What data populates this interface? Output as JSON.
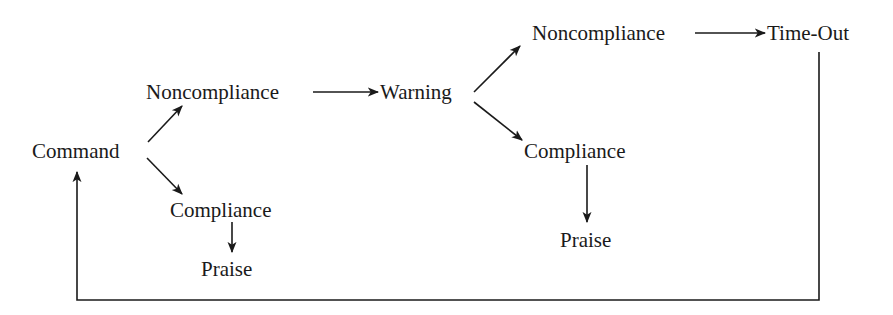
{
  "diagram": {
    "type": "flowchart",
    "nodes": {
      "command": "Command",
      "noncompliance1": "Noncompliance",
      "compliance1": "Compliance",
      "praise1": "Praise",
      "warning": "Warning",
      "noncompliance2": "Noncompliance",
      "timeout": "Time-Out",
      "compliance2": "Compliance",
      "praise2": "Praise"
    },
    "edges": [
      {
        "from": "Command",
        "to": "Noncompliance"
      },
      {
        "from": "Command",
        "to": "Compliance"
      },
      {
        "from": "Compliance",
        "to": "Praise"
      },
      {
        "from": "Noncompliance",
        "to": "Warning"
      },
      {
        "from": "Warning",
        "to": "Noncompliance"
      },
      {
        "from": "Warning",
        "to": "Compliance"
      },
      {
        "from": "Compliance",
        "to": "Praise"
      },
      {
        "from": "Noncompliance",
        "to": "Time-Out"
      },
      {
        "from": "Time-Out",
        "to": "Command"
      }
    ],
    "colors": {
      "ink": "#1a1a1a",
      "background": "#ffffff"
    }
  }
}
